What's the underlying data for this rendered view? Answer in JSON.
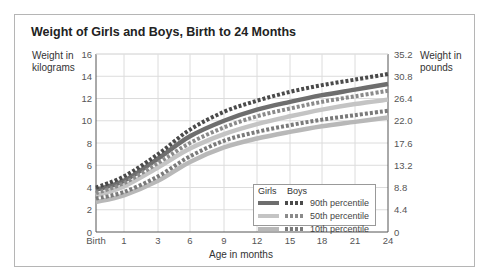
{
  "chart_data": {
    "type": "line",
    "title": "Weight of Girls and Boys, Birth to 24 Months",
    "xlabel": "Age in months",
    "ylabel_left": "Weight in kilograms",
    "ylabel_right": "Weight in pounds",
    "x": [
      "Birth",
      "1",
      "3",
      "6",
      "9",
      "12",
      "15",
      "18",
      "21",
      "24"
    ],
    "x_months": [
      0,
      1,
      3,
      6,
      9,
      12,
      15,
      18,
      21,
      24
    ],
    "y_left_ticks": [
      0,
      2,
      4,
      6,
      8,
      10,
      12,
      14,
      16
    ],
    "y_right_ticks": [
      "0",
      "4.4",
      "8.8",
      "13.2",
      "17.6",
      "22.0",
      "26.4",
      "30.8",
      "35.2"
    ],
    "ylim": [
      0,
      16
    ],
    "grid": true,
    "legend_position": "lower right (inside plot)",
    "series": [
      {
        "name": "Girls 90th percentile",
        "group": "Girls",
        "percentile": "90th",
        "style": "solid",
        "color": "#6e6e6e",
        "values": [
          3.8,
          4.6,
          6.6,
          8.6,
          10.0,
          11.0,
          11.7,
          12.3,
          12.8,
          13.3
        ]
      },
      {
        "name": "Boys 90th percentile",
        "group": "Boys",
        "percentile": "90th",
        "style": "dotted",
        "color": "#4a4a4a",
        "values": [
          4.0,
          5.0,
          7.0,
          9.2,
          10.8,
          11.8,
          12.6,
          13.2,
          13.7,
          14.2
        ]
      },
      {
        "name": "Girls 50th percentile",
        "group": "Girls",
        "percentile": "50th",
        "style": "solid",
        "color": "#c4c4c4",
        "values": [
          3.3,
          4.1,
          5.8,
          7.5,
          8.8,
          9.7,
          10.4,
          11.0,
          11.5,
          11.9
        ]
      },
      {
        "name": "Boys 50th percentile",
        "group": "Boys",
        "percentile": "50th",
        "style": "dotted",
        "color": "#8a8a8a",
        "values": [
          3.5,
          4.4,
          6.2,
          8.0,
          9.4,
          10.4,
          11.1,
          11.7,
          12.2,
          12.7
        ]
      },
      {
        "name": "Girls 10th percentile",
        "group": "Girls",
        "percentile": "10th",
        "style": "solid",
        "color": "#b8b8b8",
        "values": [
          2.7,
          3.3,
          4.6,
          6.3,
          7.6,
          8.4,
          9.0,
          9.5,
          9.9,
          10.3
        ]
      },
      {
        "name": "Boys 10th percentile",
        "group": "Boys",
        "percentile": "10th",
        "style": "dotted",
        "color": "#7a7a7a",
        "values": [
          3.0,
          3.6,
          5.0,
          6.8,
          8.2,
          9.0,
          9.6,
          10.1,
          10.5,
          10.9
        ]
      }
    ]
  },
  "labels": {
    "title": "Weight of Girls and Boys, Birth to 24 Months",
    "ylabel_left_line1": "Weight in",
    "ylabel_left_line2": "kilograms",
    "ylabel_right_line1": "Weight in",
    "ylabel_right_line2": "pounds",
    "xlabel": "Age in months"
  },
  "legend": {
    "girls_header": "Girls",
    "boys_header": "Boys",
    "rows": [
      {
        "label": "90th percentile",
        "girl_color": "#6e6e6e",
        "boy_color": "#4a4a4a"
      },
      {
        "label": "50th percentile",
        "girl_color": "#c4c4c4",
        "boy_color": "#8a8a8a"
      },
      {
        "label": "10th percentile",
        "girl_color": "#b8b8b8",
        "boy_color": "#7a7a7a"
      }
    ]
  }
}
